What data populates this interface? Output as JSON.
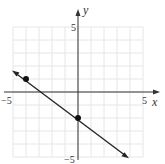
{
  "chart_data": {
    "type": "line",
    "title": "",
    "xlabel": "x",
    "ylabel": "y",
    "xlim": [
      -5,
      5
    ],
    "ylim": [
      -5,
      5
    ],
    "grid": true,
    "tick_labels": {
      "x": [
        "-5",
        "5"
      ],
      "y": [
        "5",
        "-5"
      ]
    },
    "series": [
      {
        "name": "line",
        "equation": "y = -3/4 x - 2",
        "points": [
          {
            "x": -4,
            "y": 1
          },
          {
            "x": 0,
            "y": -2
          }
        ],
        "arrows": "both"
      }
    ]
  },
  "labels": {
    "x_axis": "x",
    "y_axis": "y",
    "x_min": "−5",
    "x_max": "5",
    "y_max": "5",
    "y_min": "−5"
  },
  "colors": {
    "grid": "#e6e6e6",
    "axis": "#333333",
    "line": "#222222"
  }
}
